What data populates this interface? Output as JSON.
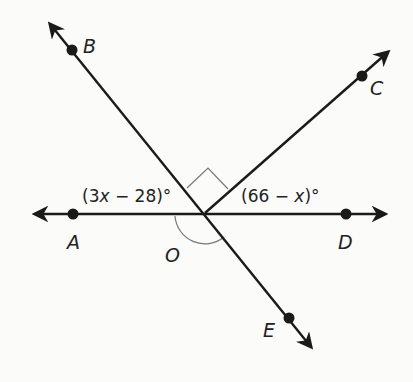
{
  "diagram": {
    "type": "angles-at-a-point",
    "vertex": {
      "label": "O",
      "x": 205,
      "y": 213
    },
    "points": [
      {
        "label": "A",
        "x": 73,
        "y": 214
      },
      {
        "label": "B",
        "x": 72,
        "y": 50
      },
      {
        "label": "C",
        "x": 362,
        "y": 76
      },
      {
        "label": "D",
        "x": 346,
        "y": 214
      },
      {
        "label": "E",
        "x": 289,
        "y": 318
      }
    ],
    "lines": [
      {
        "name": "line-AD",
        "from": [
          30,
          214
        ],
        "to": [
          390,
          214
        ],
        "arrows": "both"
      },
      {
        "name": "line-BE",
        "from": [
          47,
          20
        ],
        "to": [
          315,
          352
        ],
        "arrows": "both"
      }
    ],
    "rays": [
      {
        "name": "ray-OC",
        "from": [
          205,
          213
        ],
        "to": [
          392,
          48
        ],
        "arrow": "end"
      }
    ],
    "angle_labels": {
      "aob": {
        "prefix": "(3",
        "var": "x",
        "suffix": " − 28)°"
      },
      "cod": {
        "prefix": "(66 − ",
        "var": "x",
        "suffix": ")°"
      }
    },
    "marks": {
      "right_angle": "angle BOC",
      "arc": "angle AOE"
    },
    "colors": {
      "stroke": "#1a1a1a",
      "mark": "#777777",
      "background": "#fbfbf9"
    }
  }
}
